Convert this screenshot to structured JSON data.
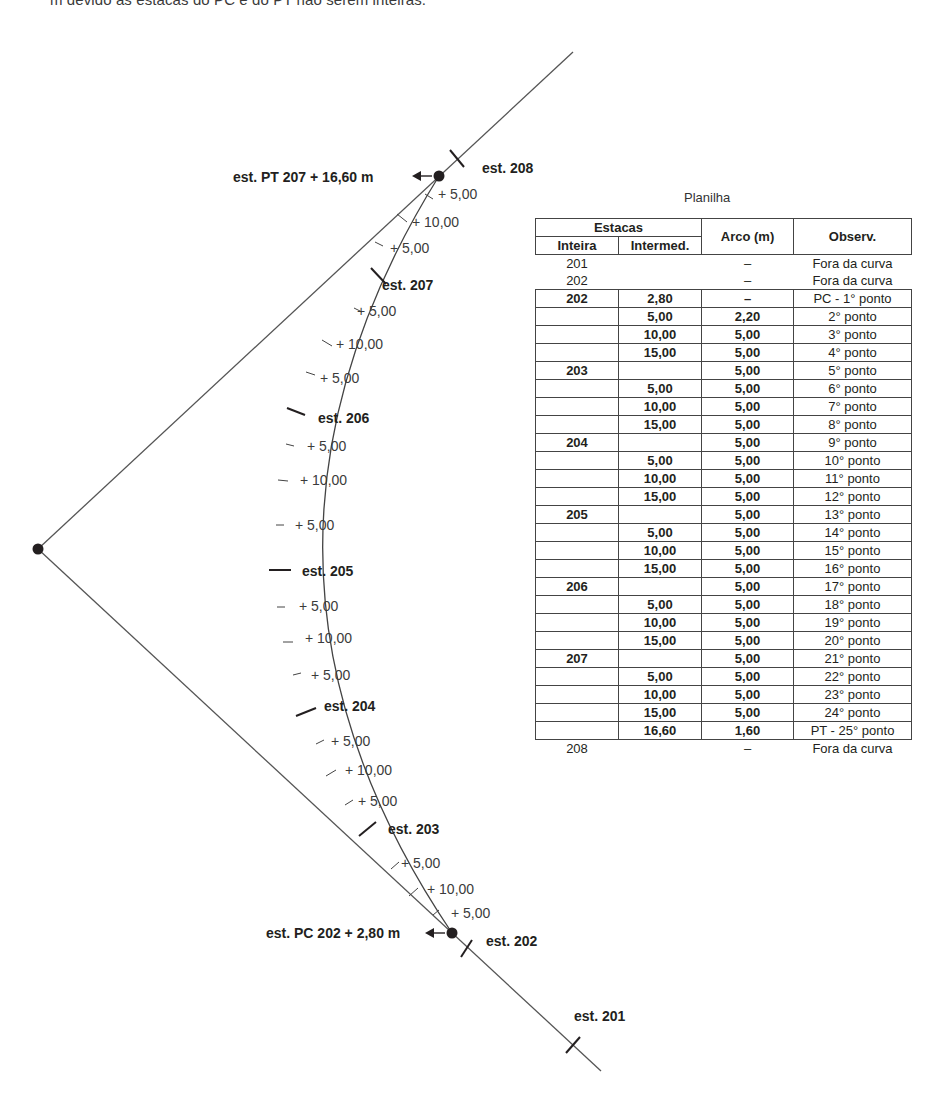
{
  "caption": "m devido às estacas do PC e do PT não serem inteiras.",
  "diagram": {
    "vertex_label": "",
    "pt_label": "est. PT 207 + 16,60 m",
    "pc_label": "est. PC 202 + 2,80 m",
    "stations": [
      {
        "id": "est208",
        "label": "est. 208"
      },
      {
        "id": "est207",
        "label": "est. 207"
      },
      {
        "id": "est206",
        "label": "est. 206"
      },
      {
        "id": "est205",
        "label": "est. 205"
      },
      {
        "id": "est204",
        "label": "est. 204"
      },
      {
        "id": "est203",
        "label": "est. 203"
      },
      {
        "id": "est202",
        "label": "est. 202"
      },
      {
        "id": "est201",
        "label": "est. 201"
      }
    ],
    "intermediate_labels": [
      "+ 5,00",
      "+ 10,00",
      "+ 5,00",
      "+ 5,00",
      "+ 10,00",
      "+ 5,00",
      "+ 5,00",
      "+ 10,00",
      "+ 5,00",
      "+ 5,00",
      "+ 10,00",
      "+ 5,00",
      "+ 5,00",
      "+ 10,00",
      "+ 5,00",
      "+ 5,00",
      "+ 10,00",
      "+ 5,00"
    ]
  },
  "sheet": {
    "title": "Planilha",
    "headers": {
      "estacas": "Estacas",
      "inteira": "Inteira",
      "intermed": "Intermed.",
      "arco": "Arco (m)",
      "observ": "Observ."
    },
    "pre_rows": [
      {
        "inteira": "201",
        "intermed": "",
        "arco": "–",
        "obs": "Fora da curva"
      },
      {
        "inteira": "202",
        "intermed": "",
        "arco": "–",
        "obs": "Fora da curva"
      }
    ],
    "rows": [
      {
        "inteira": "202",
        "intermed": "2,80",
        "arco": "–",
        "obs": "PC - 1° ponto"
      },
      {
        "inteira": "",
        "intermed": "5,00",
        "arco": "2,20",
        "obs": "2° ponto"
      },
      {
        "inteira": "",
        "intermed": "10,00",
        "arco": "5,00",
        "obs": "3° ponto"
      },
      {
        "inteira": "",
        "intermed": "15,00",
        "arco": "5,00",
        "obs": "4° ponto"
      },
      {
        "inteira": "203",
        "intermed": "",
        "arco": "5,00",
        "obs": "5° ponto"
      },
      {
        "inteira": "",
        "intermed": "5,00",
        "arco": "5,00",
        "obs": "6° ponto"
      },
      {
        "inteira": "",
        "intermed": "10,00",
        "arco": "5,00",
        "obs": "7° ponto"
      },
      {
        "inteira": "",
        "intermed": "15,00",
        "arco": "5,00",
        "obs": "8° ponto"
      },
      {
        "inteira": "204",
        "intermed": "",
        "arco": "5,00",
        "obs": "9° ponto"
      },
      {
        "inteira": "",
        "intermed": "5,00",
        "arco": "5,00",
        "obs": "10° ponto"
      },
      {
        "inteira": "",
        "intermed": "10,00",
        "arco": "5,00",
        "obs": "11° ponto"
      },
      {
        "inteira": "",
        "intermed": "15,00",
        "arco": "5,00",
        "obs": "12° ponto"
      },
      {
        "inteira": "205",
        "intermed": "",
        "arco": "5,00",
        "obs": "13° ponto"
      },
      {
        "inteira": "",
        "intermed": "5,00",
        "arco": "5,00",
        "obs": "14° ponto"
      },
      {
        "inteira": "",
        "intermed": "10,00",
        "arco": "5,00",
        "obs": "15° ponto"
      },
      {
        "inteira": "",
        "intermed": "15,00",
        "arco": "5,00",
        "obs": "16° ponto"
      },
      {
        "inteira": "206",
        "intermed": "",
        "arco": "5,00",
        "obs": "17° ponto"
      },
      {
        "inteira": "",
        "intermed": "5,00",
        "arco": "5,00",
        "obs": "18° ponto"
      },
      {
        "inteira": "",
        "intermed": "10,00",
        "arco": "5,00",
        "obs": "19° ponto"
      },
      {
        "inteira": "",
        "intermed": "15,00",
        "arco": "5,00",
        "obs": "20° ponto"
      },
      {
        "inteira": "207",
        "intermed": "",
        "arco": "5,00",
        "obs": "21° ponto"
      },
      {
        "inteira": "",
        "intermed": "5,00",
        "arco": "5,00",
        "obs": "22° ponto"
      },
      {
        "inteira": "",
        "intermed": "10,00",
        "arco": "5,00",
        "obs": "23° ponto"
      },
      {
        "inteira": "",
        "intermed": "15,00",
        "arco": "5,00",
        "obs": "24° ponto"
      },
      {
        "inteira": "",
        "intermed": "16,60",
        "arco": "1,60",
        "obs": "PT - 25° ponto"
      }
    ],
    "post_rows": [
      {
        "inteira": "208",
        "intermed": "",
        "arco": "–",
        "obs": "Fora da curva"
      }
    ]
  }
}
